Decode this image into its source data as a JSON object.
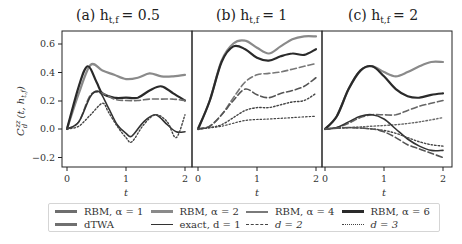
{
  "chart_data": [
    {
      "type": "line",
      "panel": "a",
      "title": "(a) h_{t,f} = 0.5",
      "xlabel": "t",
      "ylabel": "C_d^{zz}(t, h_{t,f})",
      "xlim": [
        0,
        2
      ],
      "ylim": [
        -0.25,
        0.68
      ],
      "xticks": [
        0,
        1,
        2
      ],
      "yticks": [
        -0.2,
        0.0,
        0.2,
        0.4,
        0.6
      ],
      "grid": false,
      "series": [
        {
          "name": "RBM, α=1 / exact d=1 (upper)",
          "t": [
            0,
            0.2,
            0.4,
            0.6,
            0.8,
            1.0,
            1.2,
            1.4,
            1.6,
            1.8,
            2.0
          ],
          "values": [
            0,
            0.25,
            0.45,
            0.41,
            0.38,
            0.35,
            0.36,
            0.39,
            0.37,
            0.37,
            0.38
          ]
        },
        {
          "name": "dTWA (upper)",
          "t": [
            0,
            0.2,
            0.35,
            0.5,
            0.6,
            0.8,
            1.0,
            1.2,
            1.4,
            1.6,
            1.8,
            2.0
          ],
          "values": [
            0,
            0.3,
            0.44,
            0.33,
            0.25,
            0.22,
            0.22,
            0.22,
            0.27,
            0.3,
            0.25,
            0.2
          ]
        },
        {
          "name": "exact, d=2",
          "t": [
            0,
            0.2,
            0.4,
            0.6,
            0.8,
            1.0,
            1.2,
            1.4,
            1.6,
            1.8,
            2.0
          ],
          "values": [
            0,
            0.05,
            0.24,
            0.25,
            0.21,
            0.2,
            0.2,
            0.21,
            0.21,
            0.21,
            0.2
          ]
        },
        {
          "name": "exact, d=1 oscillation",
          "t": [
            0,
            0.2,
            0.4,
            0.55,
            0.7,
            0.85,
            1.0,
            1.1,
            1.3,
            1.5,
            1.7,
            1.85,
            2.0
          ],
          "values": [
            0,
            0.05,
            0.23,
            0.26,
            0.15,
            0.03,
            -0.03,
            -0.05,
            0.05,
            0.1,
            0.03,
            -0.02,
            -0.02
          ]
        },
        {
          "name": "exact, d=3 (dotted)",
          "t": [
            0,
            0.2,
            0.4,
            0.6,
            0.7,
            0.85,
            1.0,
            1.1,
            1.3,
            1.5,
            1.7,
            1.85,
            2.0
          ],
          "values": [
            0,
            0.02,
            0.1,
            0.18,
            0.12,
            0.02,
            -0.06,
            -0.09,
            0.03,
            0.1,
            0.05,
            -0.06,
            0.1
          ]
        }
      ]
    },
    {
      "type": "line",
      "panel": "b",
      "title": "(b) h_{t,f} = 1",
      "xlabel": "t",
      "xlim": [
        0,
        2
      ],
      "xticks": [
        0,
        1,
        2
      ],
      "grid": false,
      "series": [
        {
          "name": "RBM upper band",
          "t": [
            0,
            0.2,
            0.4,
            0.6,
            0.8,
            1.0,
            1.2,
            1.4,
            1.6,
            1.8,
            2.0
          ],
          "values": [
            0,
            0.2,
            0.48,
            0.6,
            0.62,
            0.57,
            0.53,
            0.58,
            0.63,
            0.65,
            0.65
          ]
        },
        {
          "name": "RBM, α=6",
          "t": [
            0,
            0.2,
            0.4,
            0.6,
            0.8,
            1.0,
            1.2,
            1.4,
            1.6,
            1.8,
            2.0
          ],
          "values": [
            0,
            0.2,
            0.47,
            0.58,
            0.56,
            0.5,
            0.48,
            0.51,
            0.53,
            0.52,
            0.56
          ]
        },
        {
          "name": "dTWA dashed upper",
          "t": [
            0,
            0.2,
            0.4,
            0.6,
            0.8,
            1.0,
            1.2,
            1.4,
            1.6,
            1.8,
            2.0
          ],
          "values": [
            0,
            0.02,
            0.1,
            0.22,
            0.33,
            0.38,
            0.39,
            0.4,
            0.42,
            0.44,
            0.46
          ]
        },
        {
          "name": "exact d=2 family",
          "t": [
            0,
            0.2,
            0.4,
            0.6,
            0.8,
            1.0,
            1.2,
            1.4,
            1.6,
            1.8,
            2.0
          ],
          "values": [
            0,
            0.02,
            0.1,
            0.2,
            0.28,
            0.24,
            0.22,
            0.25,
            0.27,
            0.3,
            0.36
          ]
        },
        {
          "name": "exact d=3 family",
          "t": [
            0,
            0.2,
            0.4,
            0.6,
            0.8,
            1.0,
            1.2,
            1.4,
            1.6,
            1.8,
            2.0
          ],
          "values": [
            0,
            0.01,
            0.03,
            0.08,
            0.13,
            0.15,
            0.15,
            0.17,
            0.19,
            0.2,
            0.25
          ]
        },
        {
          "name": "d=3 lowest",
          "t": [
            0,
            0.4,
            0.8,
            1.2,
            1.6,
            2.0
          ],
          "values": [
            0,
            0.02,
            0.06,
            0.07,
            0.08,
            0.09
          ]
        }
      ]
    },
    {
      "type": "line",
      "panel": "c",
      "title": "(c) h_{t,f} = 2",
      "xlabel": "t",
      "xlim": [
        0,
        2
      ],
      "xticks": [
        0,
        1,
        2
      ],
      "grid": false,
      "series": [
        {
          "name": "RBM upper",
          "t": [
            0,
            0.2,
            0.4,
            0.6,
            0.8,
            1.0,
            1.2,
            1.4,
            1.6,
            1.8,
            2.0
          ],
          "values": [
            0,
            0.09,
            0.28,
            0.41,
            0.44,
            0.4,
            0.37,
            0.4,
            0.44,
            0.47,
            0.47
          ]
        },
        {
          "name": "RBM, α=6 / exact d=1",
          "t": [
            0,
            0.2,
            0.4,
            0.6,
            0.8,
            1.0,
            1.2,
            1.4,
            1.6,
            1.8,
            2.0
          ],
          "values": [
            0,
            0.09,
            0.28,
            0.41,
            0.44,
            0.37,
            0.28,
            0.23,
            0.22,
            0.24,
            0.25
          ]
        },
        {
          "name": "exact, d=2 (dashed)",
          "t": [
            0,
            0.2,
            0.4,
            0.6,
            0.8,
            1.0,
            1.2,
            1.4,
            1.6,
            1.8,
            2.0
          ],
          "values": [
            0,
            0.01,
            0.04,
            0.08,
            0.1,
            0.1,
            0.1,
            0.13,
            0.16,
            0.18,
            0.2
          ]
        },
        {
          "name": "exact, d=3 (dotted)",
          "t": [
            0,
            0.4,
            0.8,
            1.2,
            1.6,
            2.0
          ],
          "values": [
            0,
            0.01,
            0.02,
            0.03,
            0.05,
            0.08
          ]
        },
        {
          "name": "descending solid",
          "t": [
            0,
            0.2,
            0.4,
            0.6,
            0.8,
            1.0,
            1.2,
            1.4,
            1.6,
            1.8,
            2.0
          ],
          "values": [
            0,
            0.01,
            0.05,
            0.09,
            0.1,
            0.07,
            0.0,
            -0.07,
            -0.12,
            -0.15,
            -0.15
          ]
        },
        {
          "name": "descending dotted",
          "t": [
            0,
            0.4,
            0.8,
            1.0,
            1.2,
            1.4,
            1.6,
            1.8,
            2.0
          ],
          "values": [
            0,
            0.01,
            0.0,
            -0.01,
            -0.03,
            -0.06,
            -0.09,
            -0.11,
            -0.12
          ]
        },
        {
          "name": "descending dashed",
          "t": [
            0,
            0.4,
            0.8,
            1.0,
            1.2,
            1.4,
            1.6,
            1.8,
            2.0
          ],
          "values": [
            0,
            0.01,
            0.0,
            -0.02,
            -0.06,
            -0.11,
            -0.14,
            -0.17,
            -0.2
          ]
        }
      ]
    }
  ],
  "figure": {
    "panel_titles": [
      "(a) h",
      "(b) h",
      "(c) h"
    ],
    "title_subscript": "t,f",
    "title_values": [
      "= 0.5",
      "= 1",
      "= 2"
    ],
    "ylabel": "C",
    "ylabel_sub": "d",
    "ylabel_sup": "zz",
    "ylabel_args": "(t, h",
    "ylabel_args_sub": "t,f",
    "ylabel_close": ")",
    "xlabel": "t",
    "yticks": [
      "0.6",
      "0.4",
      "0.2",
      "0.0",
      "−0.2"
    ],
    "xticks": [
      "0",
      "1",
      "2"
    ]
  },
  "legend": {
    "items": [
      {
        "label": "RBM, α = 1",
        "color": "#6e6e6e",
        "style": "solid",
        "width": 3
      },
      {
        "label": "RBM, α = 2",
        "color": "#8a8a8a",
        "style": "solid",
        "width": 3
      },
      {
        "label": "RBM, α = 4",
        "color": "#7a7a7a",
        "style": "solid",
        "width": 2
      },
      {
        "label": "RBM, α = 6",
        "color": "#2a2a2a",
        "style": "solid",
        "width": 3
      },
      {
        "label": "dTWA",
        "color": "#707070",
        "style": "solid",
        "width": 3
      },
      {
        "label": "exact, d = 1",
        "color": "#333333",
        "style": "solid",
        "width": 1.5
      },
      {
        "label": "d = 2",
        "color": "#444444",
        "style": "dashed",
        "width": 1.5
      },
      {
        "label": "d = 3",
        "color": "#444444",
        "style": "dotted",
        "width": 1.2
      }
    ]
  },
  "colors": {
    "axes": "#222222",
    "rbm_light": "#8a8a8a",
    "rbm_mid": "#6e6e6e",
    "dark": "#2a2a2a",
    "legend_border": "#d5d5d5"
  }
}
